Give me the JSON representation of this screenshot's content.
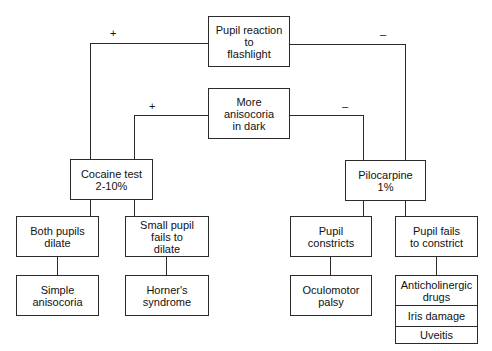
{
  "diagram": {
    "type": "decision-flowchart",
    "nodes": {
      "root": {
        "label": "Pupil reaction to flashlight",
        "lines": [
          "Pupil reaction",
          "to",
          "flashlight"
        ]
      },
      "dark": {
        "label": "More anisocoria in dark",
        "lines": [
          "More",
          "anisocoria",
          "in dark"
        ]
      },
      "cocaine": {
        "label": "Cocaine test 2-10%",
        "lines": [
          "Cocaine test",
          "2-10%"
        ]
      },
      "pilocarpine": {
        "label": "Pilocarpine 1%",
        "lines": [
          "Pilocarpine",
          "1%"
        ]
      },
      "both_dilate": {
        "label": "Both pupils dilate",
        "lines": [
          "Both pupils",
          "dilate"
        ]
      },
      "small_fails": {
        "label": "Small pupil fails to dilate",
        "lines": [
          "Small pupil",
          "fails to",
          "dilate"
        ]
      },
      "constricts": {
        "label": "Pupil constricts",
        "lines": [
          "Pupil",
          "constricts"
        ]
      },
      "fails_constrict": {
        "label": "Pupil fails to constrict",
        "lines": [
          "Pupil fails",
          "to constrict"
        ]
      },
      "simple": {
        "label": "Simple anisocoria",
        "lines": [
          "Simple",
          "anisocoria"
        ]
      },
      "horner": {
        "label": "Horner's syndrome",
        "lines": [
          "Horner's",
          "syndrome"
        ]
      },
      "oculomotor": {
        "label": "Oculomotor palsy",
        "lines": [
          "Oculomotor",
          "palsy"
        ]
      },
      "causes": {
        "items": [
          {
            "lines": [
              "Anticholinergic",
              "drugs"
            ]
          },
          {
            "lines": [
              "Iris damage"
            ]
          },
          {
            "lines": [
              "Uveitis"
            ]
          }
        ]
      }
    },
    "edges": [
      {
        "from": "root",
        "to": "cocaine",
        "label": "+"
      },
      {
        "from": "root",
        "to": "pilocarpine",
        "label": "–"
      },
      {
        "from": "dark",
        "to": "cocaine",
        "label": "+"
      },
      {
        "from": "dark",
        "to": "pilocarpine",
        "label": "–"
      },
      {
        "from": "cocaine",
        "to": "both_dilate",
        "label": ""
      },
      {
        "from": "cocaine",
        "to": "small_fails",
        "label": ""
      },
      {
        "from": "both_dilate",
        "to": "simple",
        "label": ""
      },
      {
        "from": "small_fails",
        "to": "horner",
        "label": ""
      },
      {
        "from": "pilocarpine",
        "to": "constricts",
        "label": ""
      },
      {
        "from": "pilocarpine",
        "to": "fails_constrict",
        "label": ""
      },
      {
        "from": "constricts",
        "to": "oculomotor",
        "label": ""
      },
      {
        "from": "fails_constrict",
        "to": "causes",
        "label": ""
      }
    ],
    "signs": {
      "root_pos": "+",
      "root_neg": "–",
      "dark_pos": "+",
      "dark_neg": "–"
    }
  }
}
